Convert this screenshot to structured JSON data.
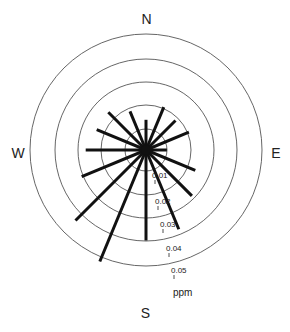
{
  "chart_data": {
    "type": "polar-bar",
    "title": "",
    "unit": "ppm",
    "compass_labels": {
      "north": "N",
      "east": "E",
      "south": "S",
      "west": "W"
    },
    "rings": [
      {
        "value": 0.01,
        "label": "0.01"
      },
      {
        "value": 0.02,
        "label": "0.02"
      },
      {
        "value": 0.03,
        "label": "0.03"
      },
      {
        "value": 0.04,
        "label": "0.04"
      },
      {
        "value": 0.05,
        "label": "0.05"
      }
    ],
    "rlim": [
      0,
      0.05
    ],
    "categories": [
      "N",
      "NNE",
      "NE",
      "ENE",
      "E",
      "ESE",
      "SE",
      "SSE",
      "S",
      "SSW",
      "SW",
      "WSW",
      "W",
      "WNW",
      "NW",
      "NNW"
    ],
    "angles_deg": [
      0,
      22.5,
      45,
      67.5,
      90,
      112.5,
      135,
      157.5,
      180,
      202.5,
      225,
      247.5,
      270,
      292.5,
      315,
      337.5
    ],
    "values": [
      0.013,
      0.02,
      0.018,
      0.02,
      0.009,
      0.023,
      0.028,
      0.037,
      0.039,
      0.052,
      0.043,
      0.03,
      0.026,
      0.023,
      0.023,
      0.018
    ]
  },
  "labels": {
    "north": "N",
    "east": "E",
    "south": "S",
    "west": "W",
    "unit": "ppm",
    "ring_0": "0.01",
    "ring_1": "0.02",
    "ring_2": "0.03",
    "ring_3": "0.04",
    "ring_4": "0.05"
  }
}
